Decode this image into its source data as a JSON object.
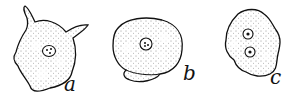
{
  "figure": {
    "cells": [
      {
        "id": "a",
        "label": "a",
        "nuclei": 1,
        "shape": "irregular-with-pseudopods"
      },
      {
        "id": "b",
        "label": "b",
        "nuclei": 1,
        "shape": "rounded"
      },
      {
        "id": "c",
        "label": "c",
        "nuclei": 2,
        "shape": "lobed"
      }
    ]
  },
  "colors": {
    "ink": "#111111",
    "background": "#ffffff"
  }
}
